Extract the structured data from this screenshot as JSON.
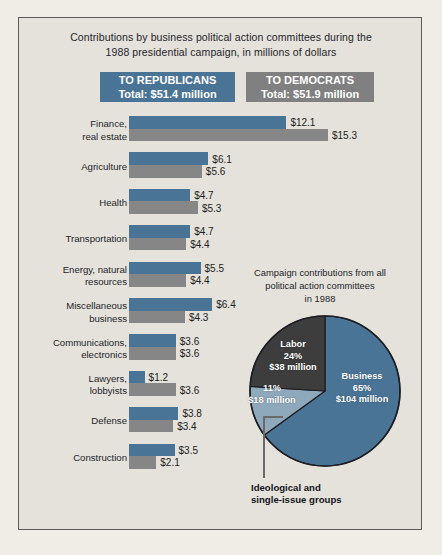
{
  "title": {
    "line1": "Contributions by business political action committees during the",
    "line2": "1988 presidential campaign, in millions of dollars"
  },
  "legend": {
    "republicans": {
      "line1": "TO REPUBLICANS",
      "line2": "Total: $51.4 million",
      "color": "#4A7496"
    },
    "democrats": {
      "line1": "TO DEMOCRATS",
      "line2": "Total: $51.9 million",
      "color": "#808080"
    }
  },
  "chart_data": {
    "type": "bar",
    "title": "Contributions by business political action committees during the 1988 presidential campaign, in millions of dollars",
    "orientation": "horizontal",
    "unit": "millions of dollars",
    "categories": [
      "Finance, real estate",
      "Agriculture",
      "Health",
      "Transportation",
      "Energy, natural resources",
      "Miscellaneous business",
      "Communications, electronics",
      "Lawyers, lobbyists",
      "Defense",
      "Construction"
    ],
    "series": [
      {
        "name": "To Republicans",
        "color": "#4A7496",
        "values": [
          12.1,
          6.1,
          4.7,
          4.7,
          5.5,
          6.4,
          3.6,
          1.2,
          3.8,
          3.5
        ],
        "total": 51.4
      },
      {
        "name": "To Democrats",
        "color": "#868686",
        "values": [
          15.3,
          5.6,
          5.3,
          4.4,
          4.4,
          4.3,
          3.6,
          3.6,
          3.4,
          2.1
        ],
        "total": 51.9
      }
    ],
    "xlim": [
      0,
      15.3
    ],
    "grid": false,
    "legend_position": "top"
  },
  "bars": [
    {
      "label_line1": "Finance,",
      "label_line2": "real estate",
      "rep": "$12.1",
      "dem": "$15.3",
      "rep_val": 12.1,
      "dem_val": 15.3
    },
    {
      "label_line1": "Agriculture",
      "label_line2": "",
      "rep": "$6.1",
      "dem": "$5.6",
      "rep_val": 6.1,
      "dem_val": 5.6
    },
    {
      "label_line1": "Health",
      "label_line2": "",
      "rep": "$4.7",
      "dem": "$5.3",
      "rep_val": 4.7,
      "dem_val": 5.3
    },
    {
      "label_line1": "Transportation",
      "label_line2": "",
      "rep": "$4.7",
      "dem": "$4.4",
      "rep_val": 4.7,
      "dem_val": 4.4
    },
    {
      "label_line1": "Energy, natural",
      "label_line2": "resources",
      "rep": "$5.5",
      "dem": "$4.4",
      "rep_val": 5.5,
      "dem_val": 4.4
    },
    {
      "label_line1": "Miscellaneous",
      "label_line2": "business",
      "rep": "$6.4",
      "dem": "$4.3",
      "rep_val": 6.4,
      "dem_val": 4.3
    },
    {
      "label_line1": "Communications,",
      "label_line2": "electronics",
      "rep": "$3.6",
      "dem": "$3.6",
      "rep_val": 3.6,
      "dem_val": 3.6
    },
    {
      "label_line1": "Lawyers,",
      "label_line2": "lobbyists",
      "rep": "$1.2",
      "dem": "$3.6",
      "rep_val": 1.2,
      "dem_val": 3.6
    },
    {
      "label_line1": "Defense",
      "label_line2": "",
      "rep": "$3.8",
      "dem": "$3.4",
      "rep_val": 3.8,
      "dem_val": 3.4
    },
    {
      "label_line1": "Construction",
      "label_line2": "",
      "rep": "$3.5",
      "dem": "$2.1",
      "rep_val": 3.5,
      "dem_val": 2.1
    }
  ],
  "pie": {
    "title_line1": "Campaign contributions from all",
    "title_line2": "political action committees",
    "title_line3": "in 1988",
    "chart_data": {
      "type": "pie",
      "title": "Campaign contributions from all political action committees in 1988",
      "labels": [
        "Business",
        "Ideological and single-issue groups",
        "Labor"
      ],
      "percentages": [
        65,
        11,
        24
      ],
      "values_millions": [
        104,
        18,
        38
      ],
      "colors": [
        "#4A7496",
        "#8FA9BC",
        "#3D3D3D"
      ],
      "start_angle_deg": 0,
      "direction": "clockwise"
    },
    "business": {
      "name": "Business",
      "pct": "65%",
      "amount": "$104 million"
    },
    "labor": {
      "name": "Labor",
      "pct": "24%",
      "amount": "$38 million"
    },
    "ideological": {
      "pct": "11%",
      "amount": "$18 million"
    },
    "callout_line1": "Ideological and",
    "callout_line2": "single-issue groups"
  }
}
